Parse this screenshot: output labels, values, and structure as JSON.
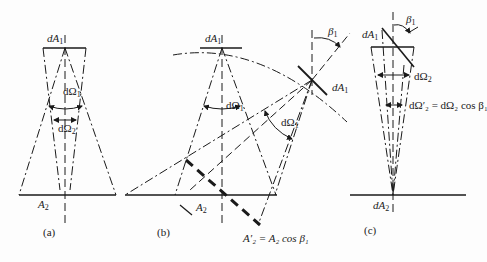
{
  "figure": {
    "panels": [
      {
        "id": "a",
        "caption": "(a)",
        "labels": {
          "source_area": "dA",
          "source_sub": "1",
          "receiver_area": "A",
          "receiver_sub": "2",
          "solid_angle_1": "dΩ",
          "solid_angle_1_sub": "1",
          "solid_angle_2": "dΩ",
          "solid_angle_2_sub": "2"
        }
      },
      {
        "id": "b",
        "caption": "(b)",
        "labels": {
          "source_area": "dA",
          "source_sub": "1",
          "tilted_source_area": "dA",
          "tilted_source_sub": "1",
          "receiver_area": "A",
          "receiver_sub": "2",
          "solid_angle": "dΩ",
          "solid_angle_sub": "1",
          "tilted_solid_angle": "dΩ",
          "tilted_solid_angle_sub": "1",
          "tilt_angle": "β",
          "tilt_angle_sub": "1",
          "projected_area_eq": "A′₂ = A₂ cos β₁"
        }
      },
      {
        "id": "c",
        "caption": "(c)",
        "labels": {
          "source_area": "dA",
          "source_sub": "1",
          "receiver_area": "dA",
          "receiver_sub": "2",
          "tilt_angle": "β",
          "tilt_angle_sub": "1",
          "solid_angle": "dΩ",
          "solid_angle_sub": "2",
          "projected_solid_angle_eq": "dΩ′₂ = dΩ₂ cos β₁"
        }
      }
    ],
    "colors": {
      "line": "#1a1a1a",
      "background": "#fdfdfd"
    }
  }
}
